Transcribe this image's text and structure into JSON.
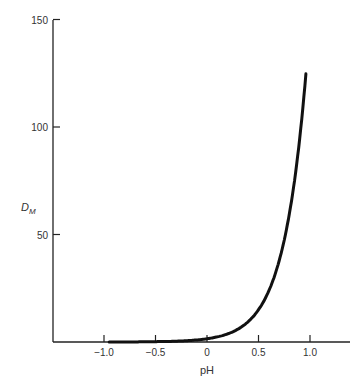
{
  "chart_data": {
    "type": "line",
    "title": "",
    "xlabel": "pH",
    "ylabel": "D",
    "ylabel_subscript": "M",
    "xlim": [
      -1.5,
      1.4
    ],
    "ylim": [
      0,
      150
    ],
    "grid": false,
    "legend": null,
    "x_ticks": [
      -1.0,
      -0.5,
      0,
      0.5,
      1.0
    ],
    "x_tick_labels": [
      "−1.0",
      "−0.5",
      "0",
      "0.5",
      "1.0"
    ],
    "y_ticks": [
      50,
      100,
      150
    ],
    "y_tick_labels": [
      "50",
      "100",
      "150"
    ],
    "series": [
      {
        "name": "D_M",
        "x": [
          -0.95,
          -0.75,
          -0.5,
          -0.25,
          0,
          0.1,
          0.2,
          0.3,
          0.4,
          0.5,
          0.6,
          0.7,
          0.8,
          0.9,
          0.95
        ],
        "y": [
          0.02,
          0.05,
          0.15,
          0.47,
          1.5,
          2.4,
          3.8,
          6.0,
          9.5,
          15.0,
          23.8,
          37.7,
          59.7,
          94.6,
          119.0
        ]
      }
    ]
  }
}
